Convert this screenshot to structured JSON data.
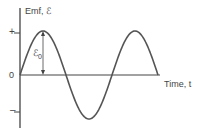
{
  "chart_data": {
    "type": "line",
    "title": "",
    "xlabel": "Time, t",
    "ylabel": "Emf, ℰ",
    "y_tick_labels": [
      "+",
      "0",
      "–"
    ],
    "annotation": {
      "label": "ℰ0",
      "meaning": "amplitude arrow from zero axis to first peak"
    },
    "series": [
      {
        "name": "emf",
        "function": "sine",
        "x": [
          0,
          0.25,
          0.5,
          0.75,
          1.0,
          1.25,
          1.5
        ],
        "values": [
          0,
          1,
          0,
          -1,
          0,
          1,
          0
        ],
        "units_x": "periods",
        "units_y": "ℰ0"
      }
    ],
    "xlim": [
      0,
      1.5
    ],
    "ylim": [
      -1.3,
      1.3
    ],
    "grid": false,
    "legend": "none",
    "colors": {
      "line": "#555555",
      "axis": "#444444"
    }
  },
  "labels": {
    "y_axis": "Emf, ℰ",
    "x_axis": "Time, t",
    "tick_plus": "+",
    "tick_zero": "0",
    "tick_minus": "–",
    "amp_symbol": "ℰ",
    "amp_sub": "0"
  }
}
